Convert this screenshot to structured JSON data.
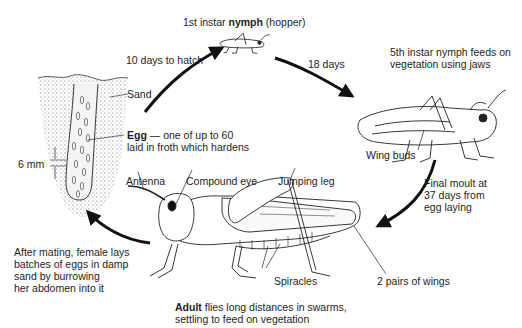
{
  "diagram": {
    "stages": [
      {
        "id": "egg",
        "label_bold": "Egg",
        "label_rest": " — one of up to 60",
        "label_line2": "laid in froth which hardens"
      },
      {
        "id": "nymph1",
        "label_pre": "1st instar ",
        "label_bold": "nymph",
        "label_post": " (hopper)"
      },
      {
        "id": "nymph5",
        "line1": "5th instar nymph feeds on",
        "line2": "vegetation using jaws"
      },
      {
        "id": "adult",
        "label_bold": "Adult",
        "label_rest": " flies long distances in swarms,",
        "label_line2": "settling to feed on vegetation"
      }
    ],
    "transitions": [
      {
        "from": "egg",
        "to": "nymph1",
        "label": "10 days to hatch"
      },
      {
        "from": "nymph1",
        "to": "nymph5",
        "label": "18 days"
      },
      {
        "from": "nymph5",
        "to": "adult",
        "line1": "Final moult at",
        "line2": "37 days from",
        "line3": "egg laying"
      },
      {
        "from": "adult",
        "to": "egg",
        "line1": "After mating, female lays",
        "line2": "batches of eggs in damp",
        "line3": "sand by burrowing",
        "line4": "her abdomen into it"
      }
    ],
    "labels": {
      "sand": "Sand",
      "egg_size": "6 mm",
      "wing_buds": "Wing buds",
      "antenna": "Antenna",
      "compound_eye": "Compound eye",
      "jumping_leg": "Jumping leg",
      "spiracles": "Spiracles",
      "wings": "2 pairs of wings"
    }
  }
}
